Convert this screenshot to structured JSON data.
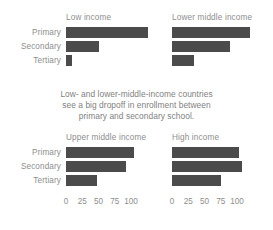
{
  "figure": {
    "background": "#ffffff",
    "bar_color": "#4b4b4b",
    "text_color": "#8e8e8e",
    "caption_lines": [
      "Low- and lower-middle-income countries",
      "see a big dropoff in enrollment between",
      "primary and secondary school."
    ]
  },
  "categories": [
    "Primary",
    "Secondary",
    "Tertiary"
  ],
  "ticks": [
    "0",
    "25",
    "50",
    "75",
    "100"
  ],
  "panels": [
    {
      "title": "Low income",
      "values": [
        126,
        51,
        9
      ]
    },
    {
      "title": "Lower middle income",
      "values": [
        120,
        89,
        34
      ]
    },
    {
      "title": "Upper middle income",
      "values": [
        105,
        93,
        48
      ]
    },
    {
      "title": "High income",
      "values": [
        103,
        107,
        75
      ]
    }
  ],
  "chart_data": {
    "type": "bar",
    "title": "",
    "subtitle": "Low- and lower-middle-income countries see a big dropoff in enrollment between primary and secondary school.",
    "orientation": "horizontal",
    "layout": "2x2 small multiples",
    "xlabel": "",
    "ylabel": "",
    "xlim": [
      0,
      110
    ],
    "xticks": [
      0,
      25,
      50,
      75,
      100
    ],
    "grid": false,
    "legend": "none",
    "categories": [
      "Primary",
      "Secondary",
      "Tertiary"
    ],
    "panels": [
      {
        "name": "Low income",
        "categories": [
          "Primary",
          "Secondary",
          "Tertiary"
        ],
        "values": [
          126,
          51,
          9
        ]
      },
      {
        "name": "Lower middle income",
        "categories": [
          "Primary",
          "Secondary",
          "Tertiary"
        ],
        "values": [
          120,
          89,
          34
        ]
      },
      {
        "name": "Upper middle income",
        "categories": [
          "Primary",
          "Secondary",
          "Tertiary"
        ],
        "values": [
          105,
          93,
          48
        ]
      },
      {
        "name": "High income",
        "categories": [
          "Primary",
          "Secondary",
          "Tertiary"
        ],
        "values": [
          103,
          107,
          75
        ]
      }
    ]
  }
}
